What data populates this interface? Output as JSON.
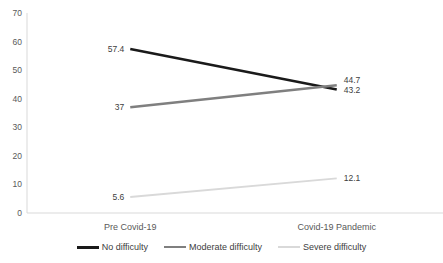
{
  "chart_data": {
    "type": "line",
    "title": "",
    "xlabel": "",
    "ylabel": "",
    "categories": [
      "Pre Covid-19",
      "Covid-19 Pandemic"
    ],
    "series": [
      {
        "name": "No difficulty",
        "values": [
          57.4,
          43.2
        ],
        "color": "#1a1a1a",
        "stroke_width": 2.6
      },
      {
        "name": "Moderate difficulty",
        "values": [
          37,
          44.7
        ],
        "color": "#7f7f7f",
        "stroke_width": 2.4
      },
      {
        "name": "Severe difficulty",
        "values": [
          5.6,
          12.1
        ],
        "color": "#d9d9d9",
        "stroke_width": 1.8
      }
    ],
    "data_labels": true,
    "ylim": [
      0,
      70
    ],
    "yticks": [
      "0",
      "10",
      "20",
      "30",
      "40",
      "50",
      "60",
      "70"
    ],
    "grid": false,
    "legend_position": "bottom"
  },
  "colors": {
    "background": "#ffffff",
    "axis_line": "#d9d9d9",
    "tick_label": "#595959",
    "category_label": "#595959",
    "data_label": "#404040",
    "legend_label": "#404040"
  }
}
